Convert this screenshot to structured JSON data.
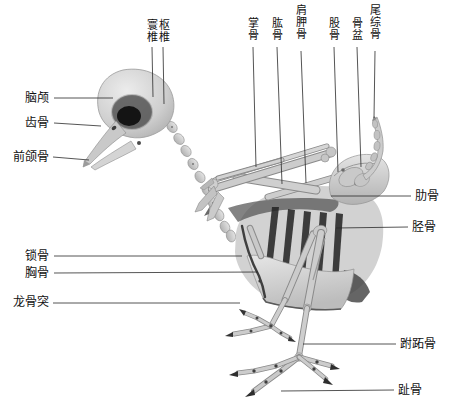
{
  "figure": {
    "kind": "bird skeleton anatomical diagram",
    "background_color": "#ffffff",
    "line_color": "#2a2a2a",
    "text_color": "#111111"
  },
  "labels": {
    "atlas": "寰椎",
    "axis": "枢椎",
    "metacarpus": "掌骨",
    "humerus": "肱骨",
    "scapula": "肩胛骨",
    "femur": "股骨",
    "pelvis": "骨盆",
    "pygostyle": "尾综骨",
    "braincase": "脑颅",
    "dentary": "齿骨",
    "premaxilla": "前颌骨",
    "clavicle": "锁骨",
    "sternum": "胸骨",
    "keel": "龙骨突",
    "ribs": "肋骨",
    "tibia": "胫骨",
    "tarsometatarsus": "跗跖骨",
    "phalanges": "趾骨"
  }
}
